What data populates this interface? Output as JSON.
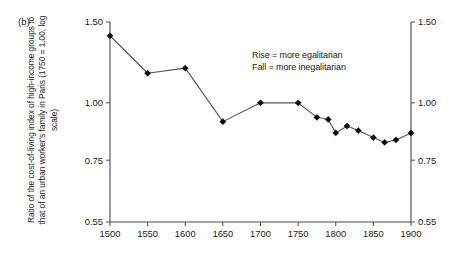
{
  "panel": {
    "label": "(b)"
  },
  "annotation": {
    "line1": "Rise = more egalitarian",
    "line2": "Fall = more inegalitarian"
  },
  "axes": {
    "ylabel": "Ratio of the cost-of-living index of high-income groups to that of an urban worker's family in Paris (1750 = 1.00, log scale)",
    "y_ticks": [
      "1.50",
      "1.00",
      "0.75",
      "0.55"
    ],
    "y_ticks_right": [
      "1.50",
      "1.00",
      "0.75",
      "0.55"
    ],
    "x_ticks": [
      "1500",
      "1550",
      "1600",
      "1650",
      "1700",
      "1750",
      "1800",
      "1850",
      "1900"
    ]
  },
  "chart_data": {
    "type": "line",
    "title": "",
    "subtitle": "",
    "xlabel": "",
    "ylabel": "Ratio of the cost-of-living index of high-income groups to that of an urban worker's family in Paris (1750 = 1.00, log scale)",
    "scale": "log",
    "xlim": [
      1500,
      1900
    ],
    "ylim": [
      0.55,
      1.5
    ],
    "grid": false,
    "legend": null,
    "xticks": [
      1500,
      1550,
      1600,
      1650,
      1700,
      1750,
      1800,
      1850,
      1900
    ],
    "yticks": [
      0.55,
      0.75,
      1.0,
      1.5
    ],
    "x": [
      1500,
      1550,
      1600,
      1650,
      1700,
      1750,
      1775,
      1790,
      1800,
      1815,
      1830,
      1850,
      1865,
      1880,
      1900
    ],
    "values": [
      1.4,
      1.16,
      1.19,
      0.91,
      1.0,
      1.0,
      0.93,
      0.92,
      0.86,
      0.89,
      0.87,
      0.84,
      0.82,
      0.83,
      0.86
    ],
    "series": [
      {
        "name": "Ratio of cost-of-living index (high-income / urban worker)",
        "values": [
          1.4,
          1.16,
          1.19,
          0.91,
          1.0,
          1.0,
          0.93,
          0.92,
          0.86,
          0.89,
          0.87,
          0.84,
          0.82,
          0.83,
          0.86
        ]
      }
    ],
    "annotations": [
      "Rise = more egalitarian",
      "Fall = more inegalitarian"
    ],
    "marker": "diamond",
    "color": "#0b0b0b"
  },
  "colors": {
    "line": "#555555",
    "marker": "#0b0b0b",
    "axis": "#4a4a4a",
    "text": "#1a1a1a",
    "background": "#ffffff"
  }
}
